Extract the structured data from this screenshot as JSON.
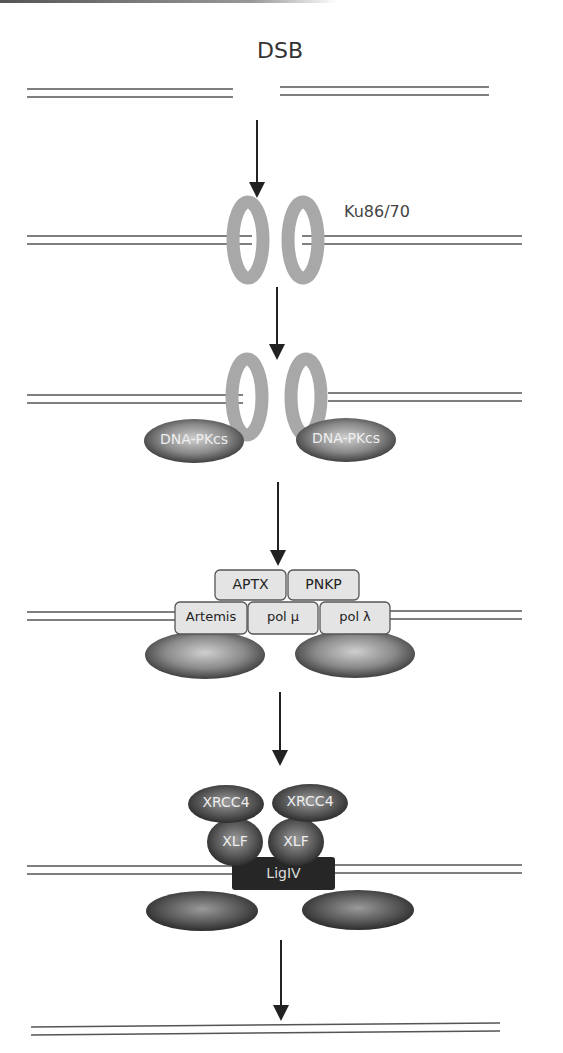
{
  "diagram": {
    "title": "DSB",
    "steps": [
      {
        "id": "dsb",
        "label": "DSB"
      },
      {
        "id": "ku",
        "label": "Ku86/70"
      },
      {
        "id": "dnapk",
        "labels": [
          "DNA-PKcs",
          "DNA-PKcs"
        ]
      },
      {
        "id": "processing",
        "top_row": [
          "APTX",
          "PNKP"
        ],
        "bottom_row": [
          "Artemis",
          "pol μ",
          "pol λ"
        ]
      },
      {
        "id": "ligation",
        "top_row": [
          "XRCC4",
          "XRCC4"
        ],
        "middle_row": [
          "XLF",
          "XLF"
        ],
        "ligase": "LigIV"
      },
      {
        "id": "repaired",
        "label": ""
      }
    ],
    "colors": {
      "dna_line": "#555555",
      "ku_ring": "#a8a8a8",
      "dnapk_dark": "#3a3a3a",
      "dnapk_light": "#c9c9c9",
      "box_fill": "#e4e4e4",
      "box_border": "#555555",
      "ligiv": "#262626",
      "arrow": "#222222"
    }
  }
}
